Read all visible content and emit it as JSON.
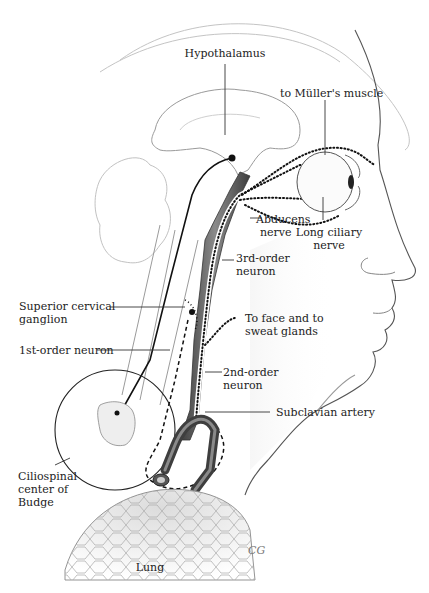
{
  "figure": {
    "colors": {
      "outline": "#6b6b6b",
      "pale_outline": "#b8b8b8",
      "artery_dark": "#4a4a4a",
      "artery_mid": "#7a7a7a",
      "nerve_fill": "#ffffff",
      "leader": "#333333",
      "lung_fill": "#e9e9e9"
    },
    "labels": {
      "hypothalamus": "Hypothalamus",
      "muller": "to Müller's muscle",
      "abducens_1": "Abducens",
      "abducens_2": "nerve",
      "long_ciliary_1": "Long ciliary",
      "long_ciliary_2": "nerve",
      "third_order_1": "3rd-order",
      "third_order_2": "neuron",
      "superior_cervical_1": "Superior cervical",
      "superior_cervical_2": "ganglion",
      "to_face_1": "To face and to",
      "to_face_2": "sweat glands",
      "first_order": "1st-order neuron",
      "second_order_1": "2nd-order",
      "second_order_2": "neuron",
      "subclavian": "Subclavian artery",
      "ciliospinal_1": "Ciliospinal",
      "ciliospinal_2": "center of",
      "ciliospinal_3": "Budge",
      "lung": "Lung"
    },
    "signature": "CG"
  }
}
